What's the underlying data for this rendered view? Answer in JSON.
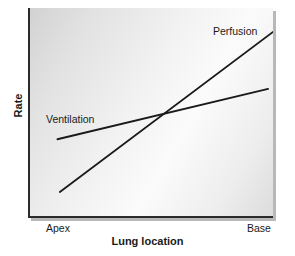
{
  "chart_data": {
    "type": "line",
    "title": "",
    "xlabel": "Lung location",
    "ylabel": "Rate",
    "xlim": [
      0,
      1
    ],
    "ylim": [
      0,
      1
    ],
    "grid": false,
    "legend_position": "inline-annotations",
    "x_tick_labels": [
      "Apex",
      "Base"
    ],
    "y_tick_labels": [],
    "annotations": [
      {
        "text": "Ventilation",
        "series": "Ventilation"
      },
      {
        "text": "Perfusion",
        "series": "Perfusion"
      }
    ],
    "series": [
      {
        "name": "Ventilation",
        "color": "#1a1a1a",
        "x": [
          0.12,
          0.98
        ],
        "values": [
          0.375,
          0.615
        ]
      },
      {
        "name": "Perfusion",
        "color": "#1a1a1a",
        "x": [
          0.13,
          1.0
        ],
        "values": [
          0.124,
          0.886
        ]
      }
    ],
    "intersection": {
      "x": 0.551,
      "y": 0.5
    }
  },
  "axes": {
    "y_title": "Rate",
    "x_title": "Lung location",
    "x_tick_left": "Apex",
    "x_tick_right": "Base"
  },
  "annotations": {
    "ventilation": "Ventilation",
    "perfusion": "Perfusion"
  },
  "style": {
    "line_color": "#1a1a1a",
    "axis_color": "#2b2b2b",
    "plot_bg_light": "#fbfbfb",
    "plot_bg_dark": "#d2d2d2",
    "page_bg": "#ffffff"
  }
}
